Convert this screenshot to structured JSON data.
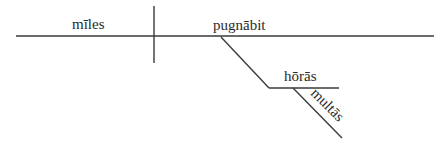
{
  "diagram": {
    "type": "sentence-diagram",
    "language": "Latin",
    "subject": "mīles",
    "verb": "pugnābit",
    "modifiers": [
      {
        "role": "adverbial-object",
        "word": "hōrās"
      },
      {
        "role": "adjective",
        "word": "multās"
      }
    ],
    "colors": {
      "ink": "#3a3a3a",
      "text": "#2a2a2a",
      "background": "#ffffff"
    }
  }
}
